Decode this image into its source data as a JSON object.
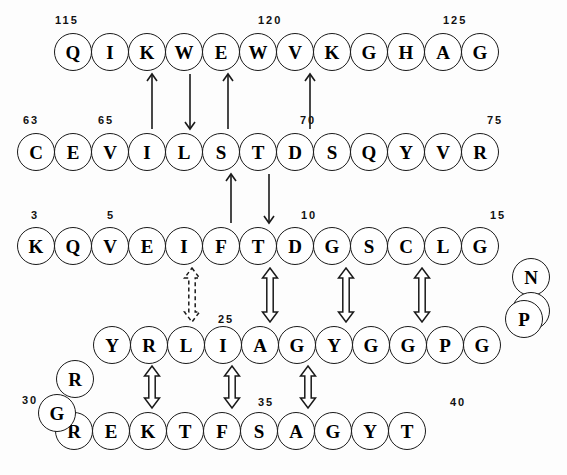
{
  "figure": {
    "circle_diameter": 38,
    "colors": {
      "stroke": "#1a1a1a",
      "background": "#ffffff",
      "text": "#000000"
    }
  },
  "rows": [
    {
      "id": "row-1",
      "y": 33,
      "x_start": 54,
      "pitch": 37,
      "residues": [
        "Q",
        "I",
        "K",
        "W",
        "E",
        "W",
        "V",
        "K",
        "G",
        "H",
        "A",
        "G"
      ]
    },
    {
      "id": "row-2",
      "y": 133,
      "x_start": 17,
      "pitch": 37,
      "residues": [
        "C",
        "E",
        "V",
        "I",
        "L",
        "S",
        "T",
        "D",
        "S",
        "Q",
        "Y",
        "V",
        "R"
      ]
    },
    {
      "id": "row-3",
      "y": 227,
      "x_start": 17,
      "pitch": 37,
      "residues": [
        "K",
        "Q",
        "V",
        "E",
        "I",
        "F",
        "T",
        "D",
        "G",
        "S",
        "C",
        "L",
        "G"
      ]
    },
    {
      "id": "row-4",
      "y": 326,
      "x_start": 93,
      "pitch": 37,
      "residues": [
        "Y",
        "R",
        "L",
        "I",
        "A",
        "G",
        "Y",
        "G",
        "G",
        "P",
        "G"
      ]
    },
    {
      "id": "row-5",
      "y": 412,
      "x_start": 55,
      "pitch": 37,
      "residues": [
        "R",
        "E",
        "K",
        "T",
        "F",
        "S",
        "A",
        "G",
        "Y",
        "T"
      ]
    }
  ],
  "offset_residues": [
    {
      "id": "offset-n",
      "label": "N",
      "x": 512,
      "y": 258
    },
    {
      "id": "offset-p-right",
      "label": "P",
      "x": 512,
      "y": 292
    },
    {
      "id": "offset-r-left",
      "label": "R",
      "x": 56,
      "y": 360
    },
    {
      "id": "offset-g-left",
      "label": "G",
      "x": 38,
      "y": 394
    },
    {
      "id": "offset-p-row4",
      "label": "P",
      "x": 505,
      "y": 300
    }
  ],
  "number_labels": [
    {
      "id": "num-115",
      "text": "115",
      "x": 55,
      "y": 14
    },
    {
      "id": "num-120",
      "text": "120",
      "x": 258,
      "y": 14
    },
    {
      "id": "num-125",
      "text": "125",
      "x": 443,
      "y": 14
    },
    {
      "id": "num-63",
      "text": "63",
      "x": 23,
      "y": 114
    },
    {
      "id": "num-65",
      "text": "65",
      "x": 98,
      "y": 114
    },
    {
      "id": "num-70",
      "text": "70",
      "x": 300,
      "y": 114
    },
    {
      "id": "num-75",
      "text": "75",
      "x": 487,
      "y": 114
    },
    {
      "id": "num-3",
      "text": "3",
      "x": 31,
      "y": 209
    },
    {
      "id": "num-5",
      "text": "5",
      "x": 107,
      "y": 209
    },
    {
      "id": "num-10",
      "text": "10",
      "x": 301,
      "y": 209
    },
    {
      "id": "num-15",
      "text": "15",
      "x": 490,
      "y": 209
    },
    {
      "id": "num-25",
      "text": "25",
      "x": 218,
      "y": 313
    },
    {
      "id": "num-30",
      "text": "30",
      "x": 22,
      "y": 394
    },
    {
      "id": "num-35",
      "text": "35",
      "x": 258,
      "y": 396
    },
    {
      "id": "num-40",
      "text": "40",
      "x": 450,
      "y": 396
    }
  ],
  "connectors": [
    {
      "id": "arrow-1",
      "style": "single-solid",
      "direction": "up",
      "x": 152,
      "y_top": 74,
      "y_bottom": 129
    },
    {
      "id": "arrow-2",
      "style": "single-solid",
      "direction": "down",
      "x": 190,
      "y_top": 74,
      "y_bottom": 129
    },
    {
      "id": "arrow-3",
      "style": "single-solid",
      "direction": "up",
      "x": 228,
      "y_top": 74,
      "y_bottom": 129
    },
    {
      "id": "arrow-4",
      "style": "single-solid",
      "direction": "up",
      "x": 310,
      "y_top": 74,
      "y_bottom": 129
    },
    {
      "id": "arrow-5",
      "style": "single-solid",
      "direction": "up",
      "x": 231,
      "y_top": 174,
      "y_bottom": 223
    },
    {
      "id": "arrow-6",
      "style": "single-solid",
      "direction": "down",
      "x": 269,
      "y_top": 174,
      "y_bottom": 223
    },
    {
      "id": "arrow-7",
      "style": "double-dashed",
      "direction": "both",
      "x": 192,
      "y_top": 268,
      "y_bottom": 322
    },
    {
      "id": "arrow-8",
      "style": "double-hollow",
      "direction": "both",
      "x": 270,
      "y_top": 268,
      "y_bottom": 322
    },
    {
      "id": "arrow-9",
      "style": "double-hollow",
      "direction": "both",
      "x": 346,
      "y_top": 268,
      "y_bottom": 322
    },
    {
      "id": "arrow-10",
      "style": "double-hollow",
      "direction": "both",
      "x": 422,
      "y_top": 268,
      "y_bottom": 322
    },
    {
      "id": "arrow-11",
      "style": "double-hollow",
      "direction": "both",
      "x": 152,
      "y_top": 366,
      "y_bottom": 408
    },
    {
      "id": "arrow-12",
      "style": "double-hollow",
      "direction": "both",
      "x": 232,
      "y_top": 366,
      "y_bottom": 408
    },
    {
      "id": "arrow-13",
      "style": "double-hollow",
      "direction": "both",
      "x": 308,
      "y_top": 366,
      "y_bottom": 408
    }
  ]
}
